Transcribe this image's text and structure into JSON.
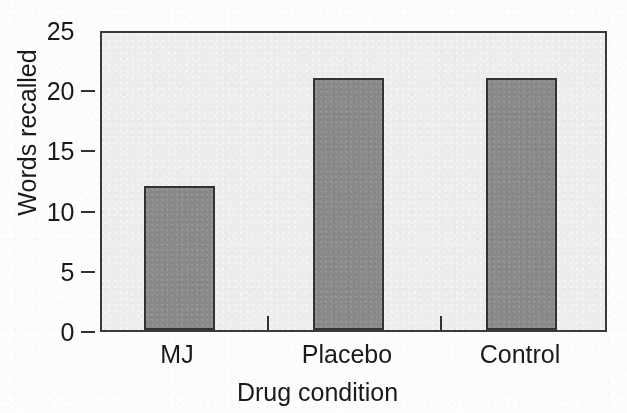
{
  "chart_data": {
    "type": "bar",
    "title": "",
    "subtitle": "",
    "xlabel": "Drug condition",
    "ylabel": "Words recalled",
    "categories": [
      "MJ",
      "Placebo",
      "Control"
    ],
    "values": [
      12.1,
      21.2,
      21.2
    ],
    "series": [
      {
        "name": "Words recalled",
        "values": [
          12.1,
          21.2,
          21.2
        ]
      }
    ],
    "ylim": [
      0,
      25
    ],
    "y_ticks": [
      0,
      5,
      10,
      15,
      20,
      25
    ],
    "y_tick_labels": [
      "0",
      "5",
      "10",
      "15",
      "20",
      "25"
    ],
    "x_tick_labels": [
      "MJ",
      "Placebo",
      "Control"
    ],
    "grid": false,
    "legend": false,
    "legend_position": "none",
    "annotations": [],
    "colors": {
      "bar_fill": "#8a8a8a",
      "bar_outline": "#333333",
      "plot_background": "#ededed",
      "axis": "#333333",
      "text": "#1a1a1a",
      "figure_background": "#fdfdfd"
    }
  },
  "figure": {
    "y_axis": {
      "title": "Words recalled",
      "ticks": [
        {
          "label": "25",
          "value": 25
        },
        {
          "label": "20",
          "value": 20
        },
        {
          "label": "15",
          "value": 15
        },
        {
          "label": "10",
          "value": 10
        },
        {
          "label": "5",
          "value": 5
        },
        {
          "label": "0",
          "value": 0
        }
      ]
    },
    "x_axis": {
      "title": "Drug condition",
      "categories": [
        {
          "label": "MJ",
          "value": 12.1
        },
        {
          "label": "Placebo",
          "value": 21.2
        },
        {
          "label": "Control",
          "value": 21.2
        }
      ]
    }
  }
}
